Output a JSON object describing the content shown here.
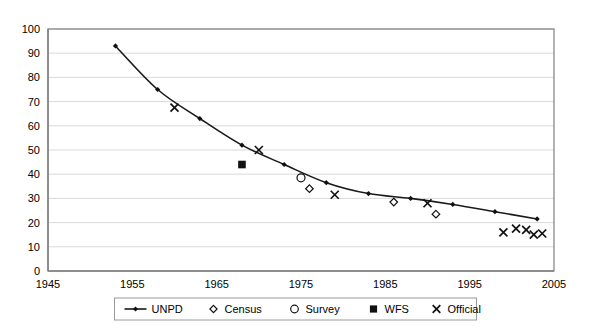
{
  "chart_data": {
    "type": "scatter",
    "title": "",
    "subtitle": "",
    "xlabel": "",
    "ylabel": "",
    "xlim": [
      1945,
      2005
    ],
    "ylim": [
      0,
      100
    ],
    "xticks": [
      1945,
      1955,
      1965,
      1975,
      1985,
      1995,
      2005
    ],
    "yticks": [
      0,
      10,
      20,
      30,
      40,
      50,
      60,
      70,
      80,
      90,
      100
    ],
    "grid": "horizontal",
    "legend_position": "bottom",
    "series": [
      {
        "name": "UNPD",
        "marker": "line-diamond",
        "points": [
          {
            "x": 1953,
            "y": 93
          },
          {
            "x": 1958,
            "y": 75
          },
          {
            "x": 1963,
            "y": 63
          },
          {
            "x": 1968,
            "y": 52
          },
          {
            "x": 1973,
            "y": 44
          },
          {
            "x": 1978,
            "y": 36.5
          },
          {
            "x": 1983,
            "y": 32
          },
          {
            "x": 1988,
            "y": 30
          },
          {
            "x": 1993,
            "y": 27.5
          },
          {
            "x": 1998,
            "y": 24.5
          },
          {
            "x": 2003,
            "y": 21.5
          }
        ]
      },
      {
        "name": "Census",
        "marker": "diamond-open",
        "points": [
          {
            "x": 1976,
            "y": 34
          },
          {
            "x": 1986,
            "y": 28.5
          },
          {
            "x": 1991,
            "y": 23.5
          }
        ]
      },
      {
        "name": "Survey",
        "marker": "circle-open",
        "points": [
          {
            "x": 1975,
            "y": 38.5
          }
        ]
      },
      {
        "name": "WFS",
        "marker": "square-filled",
        "points": [
          {
            "x": 1968,
            "y": 44
          }
        ]
      },
      {
        "name": "Official",
        "marker": "x",
        "points": [
          {
            "x": 1960,
            "y": 67.5
          },
          {
            "x": 1970,
            "y": 50
          },
          {
            "x": 1979,
            "y": 31.5
          },
          {
            "x": 1990,
            "y": 28
          },
          {
            "x": 1999,
            "y": 16
          },
          {
            "x": 2000.5,
            "y": 17.5
          },
          {
            "x": 2001.7,
            "y": 17
          },
          {
            "x": 2002.6,
            "y": 15
          },
          {
            "x": 2003.6,
            "y": 15.5
          }
        ]
      }
    ],
    "legend": [
      {
        "label": "UNPD",
        "marker": "line-diamond"
      },
      {
        "label": "Census",
        "marker": "diamond-open"
      },
      {
        "label": "Survey",
        "marker": "circle-open"
      },
      {
        "label": "WFS",
        "marker": "square-filled"
      },
      {
        "label": "Official",
        "marker": "x"
      }
    ],
    "colors": {
      "series": "#111111",
      "gridline": "#d9d9d9",
      "axis": "#808080",
      "background": "#ffffff"
    }
  }
}
